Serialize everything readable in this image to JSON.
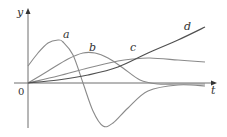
{
  "chart_data": {
    "type": "line",
    "title": "",
    "xlabel": "t",
    "ylabel": "y",
    "origin_label": "0",
    "grid": false,
    "legend": "inline curve labels",
    "axis_ranges": {
      "x": [
        0,
        180
      ],
      "y": [
        -45,
        75
      ]
    },
    "series": [
      {
        "name": "a",
        "x": [
          0,
          10,
          20,
          30,
          35,
          45,
          55,
          65,
          75,
          85,
          100,
          120,
          150,
          177
        ],
        "y": [
          17,
          30,
          40,
          43,
          41,
          28,
          0,
          -28,
          -43,
          -40,
          -25,
          -8,
          -2,
          -3
        ]
      },
      {
        "name": "b",
        "x": [
          0,
          20,
          40,
          55,
          67,
          80,
          95,
          112,
          130,
          150,
          177
        ],
        "y": [
          0,
          12,
          24,
          30,
          30,
          25,
          15,
          3,
          -1,
          -1,
          -1
        ]
      },
      {
        "name": "c",
        "x": [
          0,
          30,
          60,
          90,
          105,
          122,
          150,
          177
        ],
        "y": [
          0,
          7,
          15,
          22,
          24,
          25,
          23,
          21
        ]
      },
      {
        "name": "d",
        "x": [
          0,
          30,
          60,
          90,
          120,
          150,
          177
        ],
        "y": [
          0,
          3,
          8,
          16,
          30,
          43,
          56
        ]
      }
    ],
    "labels": {
      "a": {
        "x": 66,
        "y": 35
      },
      "b": {
        "x": 92,
        "y": 48
      },
      "c": {
        "x": 133,
        "y": 48
      },
      "d": {
        "x": 187,
        "y": 27
      }
    }
  },
  "axes": {
    "y_label": "y",
    "t_label": "t",
    "origin": "0"
  },
  "curve_labels": {
    "a": "a",
    "b": "b",
    "c": "c",
    "d": "d"
  }
}
